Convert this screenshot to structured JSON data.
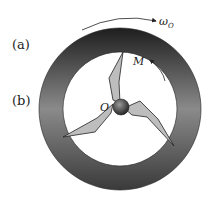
{
  "labels": {
    "part_a": "(a)",
    "part_b": "(b)",
    "angular_velocity": "ω",
    "angular_velocity_sub": "O",
    "moment": "M",
    "center": "O"
  },
  "colors": {
    "ring_dark": "#2a2a2a",
    "ring_light": "#9a9a9a",
    "blade_fill": "#bdbdbd",
    "hub": "#555555"
  }
}
